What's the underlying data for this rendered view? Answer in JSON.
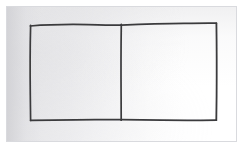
{
  "document": {
    "kind": "scanned-hand-drawing",
    "caption": "Hand-drawn rectangle divided into two equal halves by a vertical line",
    "background_color": "#ffffff",
    "paper_color_left": "#e6e6e8",
    "paper_color_right": "#ffffff",
    "frame_border_color": "#d9dade",
    "ink_color": "#3a3a3c"
  },
  "plate": {
    "frame_label": "scan-plate-frame",
    "x": 6,
    "y": 6,
    "width": 231,
    "height": 136
  },
  "figure": {
    "shape_type": "rectangle-with-vertical-divider",
    "stroke_color": "#3a3a3c",
    "stroke_width": 1.6,
    "outer_rect": {
      "label": "outer-rectangle",
      "left": 30,
      "top": 25,
      "right": 216,
      "bottom": 120,
      "width": 186,
      "height": 95
    },
    "divider": {
      "label": "vertical-divider-line",
      "x": 121,
      "top": 24,
      "bottom": 120
    },
    "left_cell": {
      "label": "left-half",
      "left": 30,
      "top": 25,
      "width": 91,
      "height": 95,
      "fill": "none",
      "text": ""
    },
    "right_cell": {
      "label": "right-half",
      "left": 121,
      "top": 24,
      "width": 95,
      "height": 96,
      "fill": "none",
      "text": ""
    }
  }
}
